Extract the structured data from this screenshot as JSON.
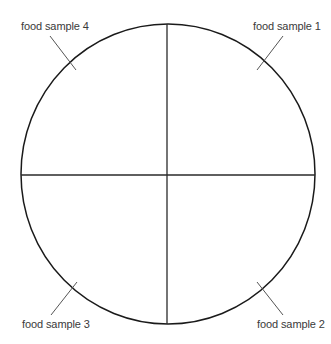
{
  "diagram": {
    "type": "quartered-circle",
    "colors": {
      "circle": "#1a1a1a",
      "dividers": "#2a2a2a",
      "leaders": "#555555",
      "text": "#3a3a3a",
      "background": "#ffffff"
    },
    "labels": [
      {
        "id": 1,
        "text": "food sample 1",
        "quadrant": "top-right"
      },
      {
        "id": 2,
        "text": "food sample 2",
        "quadrant": "bottom-right"
      },
      {
        "id": 3,
        "text": "food sample 3",
        "quadrant": "bottom-left"
      },
      {
        "id": 4,
        "text": "food sample 4",
        "quadrant": "top-left"
      }
    ]
  }
}
